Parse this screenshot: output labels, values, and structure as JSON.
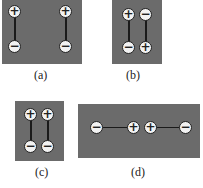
{
  "figure": {
    "panels": [
      {
        "id": "a",
        "label": "(a)",
        "description": "two dipoles side by side, same orientation (+ top, - bottom)",
        "charges": [
          [
            "+",
            "-"
          ],
          [
            "+",
            "-"
          ]
        ]
      },
      {
        "id": "b",
        "label": "(b)",
        "description": "two dipoles side by side, opposite orientation",
        "charges": [
          [
            "+",
            "-"
          ],
          [
            "-",
            "+"
          ]
        ]
      },
      {
        "id": "c",
        "label": "(c)",
        "description": "two dipoles close together, same orientation",
        "charges": [
          [
            "+",
            "-"
          ],
          [
            "+",
            "-"
          ]
        ]
      },
      {
        "id": "d",
        "label": "(d)",
        "description": "two dipoles end to end, horizontal, + ends facing",
        "charges": [
          "-",
          "+",
          "+",
          "-"
        ]
      }
    ],
    "symbols": {
      "plus": "+",
      "minus": "−"
    },
    "colors": {
      "panel": "#6b6b6b",
      "charge_fill": "#f2f2f2",
      "line": "#1a1a1a"
    }
  }
}
